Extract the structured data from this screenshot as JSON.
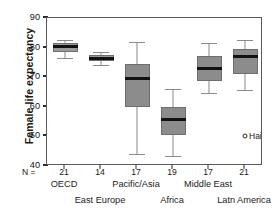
{
  "chart_data": {
    "type": "box",
    "title": "",
    "xlabel": "",
    "ylabel": "Female life expectancy",
    "ylim": [
      40,
      90
    ],
    "yticks": [
      40,
      50,
      60,
      70,
      80,
      90
    ],
    "grid": false,
    "legend": "none",
    "n_row_label": "N =",
    "categories": [
      "OECD",
      "East Europe",
      "Pacific/Asia",
      "Africa",
      "Middle East",
      "Latn America"
    ],
    "counts": [
      21,
      14,
      17,
      19,
      17,
      21
    ],
    "boxes": [
      {
        "category": "OECD",
        "n": 21,
        "whisker_low": 76.5,
        "q1": 78.6,
        "median": 80.3,
        "q3": 81.4,
        "whisker_high": 82.4,
        "outliers": []
      },
      {
        "category": "East Europe",
        "n": 14,
        "whisker_low": 74.0,
        "q1": 75.4,
        "median": 76.4,
        "q3": 77.6,
        "whisker_high": 78.6,
        "outliers": []
      },
      {
        "category": "Pacific/Asia",
        "n": 17,
        "whisker_low": 44.0,
        "q1": 60.0,
        "median": 69.6,
        "q3": 74.6,
        "whisker_high": 82.0,
        "outliers": []
      },
      {
        "category": "Africa",
        "n": 19,
        "whisker_low": 43.5,
        "q1": 50.4,
        "median": 55.6,
        "q3": 60.0,
        "whisker_high": 66.0,
        "outliers": []
      },
      {
        "category": "Middle East",
        "n": 17,
        "whisker_low": 64.6,
        "q1": 68.6,
        "median": 73.0,
        "q3": 77.0,
        "whisker_high": 81.4,
        "outliers": []
      },
      {
        "category": "Latn America",
        "n": 21,
        "whisker_low": 65.6,
        "q1": 71.0,
        "median": 77.0,
        "q3": 79.4,
        "whisker_high": 82.4,
        "outliers": [
          {
            "label": "Haiti",
            "value": 50.0
          }
        ]
      }
    ],
    "colors": {
      "box_fill": "#8c8c8c",
      "box_edge": "#6e6e6e",
      "median": "#111111",
      "whisker": "#8a8a8a",
      "frame": "#5a5a5a",
      "background": "#ffffff",
      "text": "#1a1a1a"
    }
  }
}
